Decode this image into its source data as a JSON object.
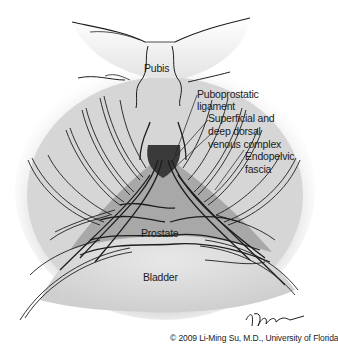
{
  "figure": {
    "labels": {
      "pubis": "Pubis",
      "puboprostatic_1": "Puboprostatic",
      "puboprostatic_2": "ligament",
      "dorsal_1": "Superficial and",
      "dorsal_2": "deep dorsal",
      "dorsal_3": "venous complex",
      "endopelvic_1": "Endopelvic",
      "endopelvic_2": "fascia",
      "prostate": "Prostate",
      "bladder": "Bladder"
    },
    "signature": "T.Phelps",
    "copyright": "© 2009 Li-Ming Su, M.D., University of Florida"
  },
  "colors": {
    "background": "#ffffff",
    "pelvic_shade": "#d9d9d9",
    "pubis_shade": "#e6e6e6",
    "prostate_shade": "#a9a9a9",
    "bladder_shade": "#e2e2e2",
    "line": "#1e1e1e"
  }
}
